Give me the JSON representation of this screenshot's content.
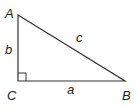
{
  "diagram": {
    "type": "right-triangle",
    "vertices": {
      "A": {
        "label": "A",
        "x": 18,
        "y": 15
      },
      "B": {
        "label": "B",
        "x": 125,
        "y": 81
      },
      "C": {
        "label": "C",
        "x": 18,
        "y": 81
      }
    },
    "sides": {
      "a": {
        "label": "a",
        "from": "C",
        "to": "B"
      },
      "b": {
        "label": "b",
        "from": "A",
        "to": "C"
      },
      "c": {
        "label": "c",
        "from": "A",
        "to": "B"
      }
    },
    "right_angle_at": "C",
    "stroke_color": "#333333"
  }
}
